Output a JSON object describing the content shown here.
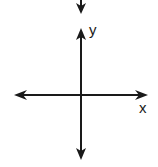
{
  "diagram": {
    "type": "coordinate-axes",
    "x_label": "x",
    "y_label": "y",
    "stroke_color": "#1a1a1a",
    "background": "#ffffff"
  }
}
